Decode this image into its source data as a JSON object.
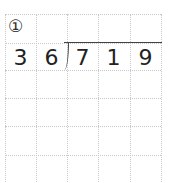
{
  "problem": {
    "number_label": "①",
    "divisor": [
      "3",
      "6"
    ],
    "dividend": [
      "7",
      "1",
      "9"
    ]
  },
  "grid": {
    "columns": 5,
    "rows": 6,
    "line_color": "#c8c8c8"
  }
}
